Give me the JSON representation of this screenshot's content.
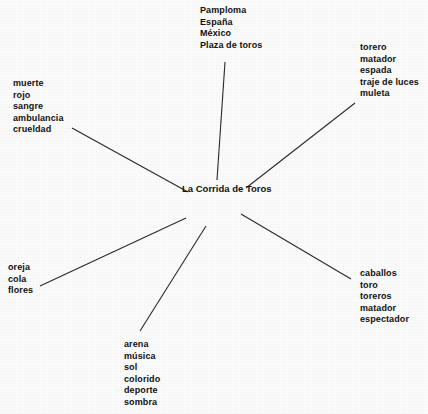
{
  "diagram": {
    "type": "spider-web / word-association map",
    "center": {
      "label_lines": [
        "La Corrida",
        "de",
        "Toros"
      ]
    },
    "branches": [
      {
        "id": "top",
        "position": "top",
        "terms": [
          "Pamploma",
          "España",
          "México",
          "Plaza de toros"
        ]
      },
      {
        "id": "upper-right",
        "position": "upper-right",
        "terms": [
          "torero",
          "matador",
          "espada",
          "traje de luces",
          "muleta"
        ]
      },
      {
        "id": "upper-left",
        "position": "upper-left",
        "terms": [
          "muerte",
          "rojo",
          "sangre",
          "ambulancia",
          "crueldad"
        ]
      },
      {
        "id": "lower-left",
        "position": "lower-left",
        "terms": [
          "oreja",
          "cola",
          "flores"
        ]
      },
      {
        "id": "lower-right",
        "position": "lower-right",
        "terms": [
          "caballos",
          "toro",
          "toreros",
          "matador",
          "espectador"
        ]
      },
      {
        "id": "bottom",
        "position": "bottom",
        "terms": [
          "arena",
          "música",
          "sol",
          "colorido",
          "deporte",
          "sombra"
        ]
      }
    ],
    "connectors": [
      {
        "id": "spoke-top",
        "x1": 225,
        "y1": 62,
        "x2": 217,
        "y2": 180
      },
      {
        "id": "spoke-upper-right",
        "x1": 246,
        "y1": 188,
        "x2": 355,
        "y2": 103
      },
      {
        "id": "spoke-upper-left",
        "x1": 72,
        "y1": 128,
        "x2": 188,
        "y2": 192
      },
      {
        "id": "spoke-lower-left",
        "x1": 40,
        "y1": 286,
        "x2": 186,
        "y2": 218
      },
      {
        "id": "spoke-lower-right",
        "x1": 241,
        "y1": 214,
        "x2": 351,
        "y2": 279
      },
      {
        "id": "spoke-bottom",
        "x1": 140,
        "y1": 331,
        "x2": 206,
        "y2": 226
      }
    ],
    "colors": {
      "background": "#fbfbfb",
      "ink": "#101010",
      "line": "#2a2a2a"
    }
  }
}
